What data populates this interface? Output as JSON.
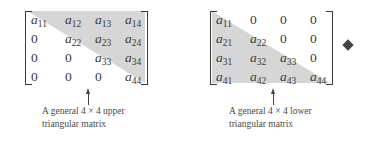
{
  "figures": [
    {
      "id": "upper",
      "caption_line1": "A general 4 × 4 upper",
      "caption_line2": "triangular matrix",
      "rows": [
        [
          {
            "v": "a",
            "s": "11"
          },
          {
            "v": "a",
            "s": "12"
          },
          {
            "v": "a",
            "s": "13"
          },
          {
            "v": "a",
            "s": "14"
          }
        ],
        [
          {
            "z": "0"
          },
          {
            "v": "a",
            "s": "22"
          },
          {
            "v": "a",
            "s": "23"
          },
          {
            "v": "a",
            "s": "24"
          }
        ],
        [
          {
            "z": "0"
          },
          {
            "z": "0"
          },
          {
            "v": "a",
            "s": "33"
          },
          {
            "v": "a",
            "s": "34"
          }
        ],
        [
          {
            "z": "0"
          },
          {
            "z": "0"
          },
          {
            "z": "0"
          },
          {
            "v": "a",
            "s": "44"
          }
        ]
      ]
    },
    {
      "id": "lower",
      "caption_line1": "A general 4 × 4 lower",
      "caption_line2": "triangular matrix",
      "rows": [
        [
          {
            "v": "a",
            "s": "11"
          },
          {
            "z": "0"
          },
          {
            "z": "0"
          },
          {
            "z": "0"
          }
        ],
        [
          {
            "v": "a",
            "s": "21"
          },
          {
            "v": "a",
            "s": "22"
          },
          {
            "z": "0"
          },
          {
            "z": "0"
          }
        ],
        [
          {
            "v": "a",
            "s": "31"
          },
          {
            "v": "a",
            "s": "32"
          },
          {
            "v": "a",
            "s": "33"
          },
          {
            "z": "0"
          }
        ],
        [
          {
            "v": "a",
            "s": "41"
          },
          {
            "v": "a",
            "s": "42"
          },
          {
            "v": "a",
            "s": "43"
          },
          {
            "v": "a",
            "s": "44"
          }
        ]
      ]
    }
  ],
  "end_marker": "diamond",
  "colors": {
    "shade": "#d6d6d6",
    "text": "#3a3a3a"
  }
}
